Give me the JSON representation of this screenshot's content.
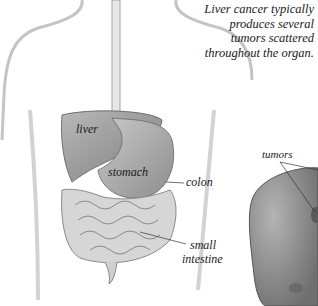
{
  "caption": "Liver cancer typically produces several tumors scattered throughout the organ.",
  "labels": {
    "liver": "liver",
    "stomach": "stomach",
    "colon": "colon",
    "small_intestine_1": "small",
    "small_intestine_2": "intestine",
    "tumors": "tumors"
  },
  "colors": {
    "body_outline": "#bdbdbd",
    "organ_gray": "#9a9a9a",
    "liver_gray": "#8c8c8c",
    "text": "#1a1a1a",
    "background": "#ffffff"
  }
}
